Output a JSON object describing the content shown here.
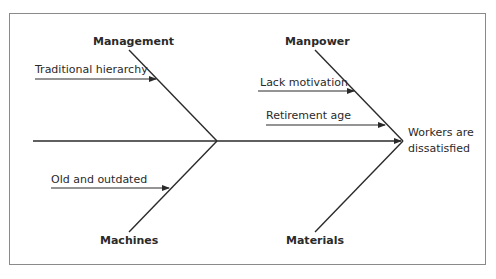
{
  "diagram": {
    "type": "fishbone",
    "effect": {
      "line1": "Workers are",
      "line2": "dissatisfied"
    },
    "categories": {
      "management": {
        "label": "Management",
        "causes": [
          "Traditional hierarchy"
        ]
      },
      "manpower": {
        "label": "Manpower",
        "causes": [
          "Lack motivation",
          "Retirement age"
        ]
      },
      "machines": {
        "label": "Machines",
        "causes": [
          "Old and outdated"
        ]
      },
      "materials": {
        "label": "Materials",
        "causes": []
      }
    },
    "colors": {
      "line": "#2a2a2a",
      "frame": "#8a8a8a",
      "background": "#ffffff"
    }
  }
}
